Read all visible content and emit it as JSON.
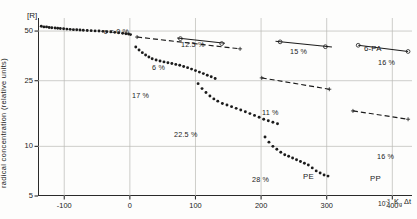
{
  "figure": {
    "corner_label": "[R]",
    "y_axis_title": "radical  concentration  (relative  units)",
    "x_axis_unit": "10",
    "x_axis_unit_exp": "-3",
    "x_axis_symbol_a": "K",
    "x_axis_symbol_sub": "g",
    "x_axis_symbol_b": "Δt"
  },
  "axes": {
    "y_ticks": [
      "50",
      "25",
      "10",
      "5"
    ],
    "y_tick_values": [
      50,
      25,
      10,
      5
    ],
    "x_ticks": [
      "-100",
      "0",
      "100",
      "200",
      "300",
      "400"
    ],
    "x_tick_values": [
      -100,
      0,
      100,
      200,
      300,
      400
    ]
  },
  "annotations": [
    {
      "name": "eps-0-label",
      "text": "ε = 0 %",
      "x": 104,
      "y": 27
    },
    {
      "name": "pct-12-5-label",
      "text": "12.5 %",
      "x": 181,
      "y": 40
    },
    {
      "name": "pct-6-label",
      "text": "6 %",
      "x": 152,
      "y": 63
    },
    {
      "name": "pct-17-label",
      "text": "17 %",
      "x": 132,
      "y": 91
    },
    {
      "name": "pct-22-5-label",
      "text": "22.5 %",
      "x": 174,
      "y": 130
    },
    {
      "name": "pct-15-label",
      "text": "15 %",
      "x": 290,
      "y": 47
    },
    {
      "name": "pct-11-label",
      "text": "11 %",
      "x": 262,
      "y": 108
    },
    {
      "name": "pct-28-label",
      "text": "28 %",
      "x": 252,
      "y": 175
    },
    {
      "name": "pe-label",
      "text": "PE",
      "x": 303,
      "y": 172
    },
    {
      "name": "pa-label",
      "text": "6-PA",
      "x": 364,
      "y": 44
    },
    {
      "name": "pct-16-top-label",
      "text": "16 %",
      "x": 378,
      "y": 58
    },
    {
      "name": "pct-16-bot-label",
      "text": "16 %",
      "x": 377,
      "y": 152
    },
    {
      "name": "pp-label",
      "text": "PP",
      "x": 370,
      "y": 174
    }
  ],
  "chart_data": {
    "type": "scatter",
    "title": "",
    "xlabel": "K_g Δt  (10^-3)",
    "ylabel": "radical concentration (relative units)",
    "xlim": [
      -140,
      430
    ],
    "ylim": [
      5,
      60
    ],
    "yscale": "log",
    "grid": true,
    "legend": "inline-annotations",
    "series": [
      {
        "name": "ε = 0 %",
        "marker": "filled-dot",
        "material": "PE",
        "points": [
          [
            -135,
            53.5
          ],
          [
            -131,
            53.0
          ],
          [
            -127,
            53.0
          ],
          [
            -123,
            52.6
          ],
          [
            -119,
            52.4
          ],
          [
            -114,
            52.2
          ],
          [
            -110,
            52.0
          ],
          [
            -106,
            51.8
          ],
          [
            -101,
            51.6
          ],
          [
            -96,
            51.4
          ],
          [
            -91,
            51.2
          ],
          [
            -86,
            51.0
          ],
          [
            -81,
            50.9
          ],
          [
            -76,
            50.7
          ],
          [
            -71,
            50.6
          ],
          [
            -65,
            50.4
          ],
          [
            -59,
            50.3
          ],
          [
            -53,
            50.1
          ],
          [
            -47,
            50.0
          ],
          [
            -41,
            49.8
          ],
          [
            -35,
            49.6
          ],
          [
            -29,
            49.4
          ],
          [
            -23,
            49.1
          ],
          [
            -17,
            48.8
          ],
          [
            -11,
            48.5
          ],
          [
            -6,
            48.2
          ],
          [
            -2,
            48.0
          ],
          [
            1,
            47.6
          ]
        ]
      },
      {
        "name": "12.5 %",
        "marker": "open-circle",
        "material": "PE",
        "points": [
          [
            77,
            45.0
          ],
          [
            140,
            42.0
          ]
        ],
        "fit_line": [
          [
            72,
            45.4
          ],
          [
            145,
            42.2
          ]
        ]
      },
      {
        "name": "6 %",
        "marker": "plus",
        "material": "PE",
        "points": [
          [
            11,
            46.0
          ],
          [
            168,
            39.0
          ]
        ],
        "fit_line": [
          [
            11,
            46.0
          ],
          [
            168,
            39.0
          ]
        ]
      },
      {
        "name": "17 %",
        "marker": "filled-dot",
        "material": "PE",
        "points": [
          [
            9,
            40.0
          ],
          [
            14,
            38.4
          ],
          [
            19,
            37.0
          ],
          [
            24,
            35.8
          ],
          [
            29,
            34.8
          ],
          [
            34,
            34.0
          ],
          [
            40,
            33.4
          ],
          [
            46,
            32.9
          ],
          [
            52,
            32.5
          ],
          [
            58,
            32.1
          ],
          [
            64,
            31.8
          ],
          [
            70,
            31.4
          ],
          [
            76,
            31.0
          ],
          [
            82,
            30.5
          ],
          [
            88,
            30.0
          ],
          [
            94,
            29.4
          ],
          [
            100,
            28.8
          ],
          [
            106,
            28.2
          ],
          [
            112,
            27.6
          ],
          [
            118,
            27.0
          ],
          [
            124,
            26.4
          ],
          [
            130,
            25.8
          ]
        ]
      },
      {
        "name": "22.5 %",
        "marker": "filled-dot",
        "material": "PE",
        "points": [
          [
            104,
            24.0
          ],
          [
            110,
            22.4
          ],
          [
            116,
            21.2
          ],
          [
            122,
            20.2
          ],
          [
            128,
            19.4
          ],
          [
            134,
            18.8
          ],
          [
            141,
            18.2
          ],
          [
            148,
            17.8
          ],
          [
            155,
            17.4
          ],
          [
            162,
            17.0
          ],
          [
            169,
            16.6
          ],
          [
            176,
            16.2
          ],
          [
            183,
            15.8
          ],
          [
            190,
            15.4
          ],
          [
            197,
            15.0
          ],
          [
            204,
            14.6
          ],
          [
            211,
            14.3
          ],
          [
            218,
            14.0
          ],
          [
            225,
            13.7
          ]
        ]
      },
      {
        "name": "15 %",
        "marker": "open-circle",
        "material": "6-PA",
        "points": [
          [
            229,
            43.0
          ],
          [
            298,
            40.2
          ]
        ],
        "fit_line": [
          [
            222,
            43.4
          ],
          [
            308,
            40.0
          ]
        ]
      },
      {
        "name": "11 %",
        "marker": "plus",
        "material": "6-PA",
        "points": [
          [
            201,
            26.0
          ],
          [
            304,
            22.2
          ]
        ],
        "fit_line": [
          [
            201,
            26.0
          ],
          [
            304,
            22.2
          ]
        ]
      },
      {
        "name": "28 %",
        "marker": "filled-dot",
        "material": "PE",
        "points": [
          [
            206,
            11.4
          ],
          [
            212,
            10.6
          ],
          [
            218,
            10.0
          ],
          [
            224,
            9.6
          ],
          [
            230,
            9.2
          ],
          [
            236,
            8.9
          ],
          [
            242,
            8.7
          ],
          [
            248,
            8.5
          ],
          [
            254,
            8.3
          ],
          [
            260,
            8.1
          ],
          [
            266,
            7.9
          ],
          [
            272,
            7.7
          ],
          [
            278,
            7.4
          ],
          [
            284,
            7.1
          ],
          [
            290,
            6.9
          ],
          [
            296,
            6.7
          ],
          [
            302,
            6.6
          ]
        ]
      },
      {
        "name": "16 % (6-PA)",
        "marker": "open-circle",
        "material": "6-PA",
        "points": [
          [
            348,
            41.0
          ],
          [
            424,
            37.6
          ]
        ],
        "fit_line": [
          [
            348,
            41.0
          ],
          [
            424,
            37.6
          ]
        ]
      },
      {
        "name": "16 % (PP)",
        "marker": "plus",
        "material": "PP",
        "points": [
          [
            340,
            16.4
          ],
          [
            424,
            14.6
          ]
        ],
        "fit_line": [
          [
            340,
            16.4
          ],
          [
            424,
            14.6
          ]
        ]
      }
    ]
  }
}
